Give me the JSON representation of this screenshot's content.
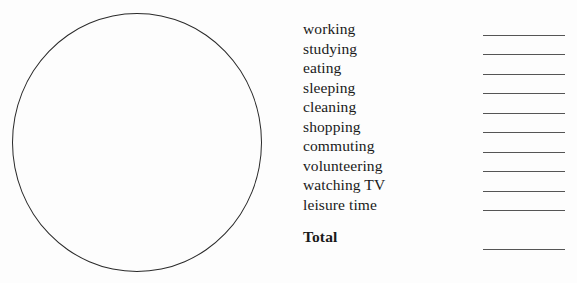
{
  "document": {
    "type": "blank-pie-chart-worksheet",
    "background_color": "#fdfdfd",
    "ink_color": "#1a1a1a",
    "rule_color": "#555555"
  },
  "pie_chart": {
    "name": "empty-pie-chart",
    "shape": "circle",
    "filled": false,
    "slices": []
  },
  "legend": {
    "items": [
      {
        "label": "working",
        "value": ""
      },
      {
        "label": "studying",
        "value": ""
      },
      {
        "label": "eating",
        "value": ""
      },
      {
        "label": "sleeping",
        "value": ""
      },
      {
        "label": "cleaning",
        "value": ""
      },
      {
        "label": "shopping",
        "value": ""
      },
      {
        "label": "commuting",
        "value": ""
      },
      {
        "label": "volunteering",
        "value": ""
      },
      {
        "label": "watching TV",
        "value": ""
      },
      {
        "label": "leisure time",
        "value": ""
      }
    ],
    "total": {
      "label": "Total",
      "value": ""
    }
  }
}
